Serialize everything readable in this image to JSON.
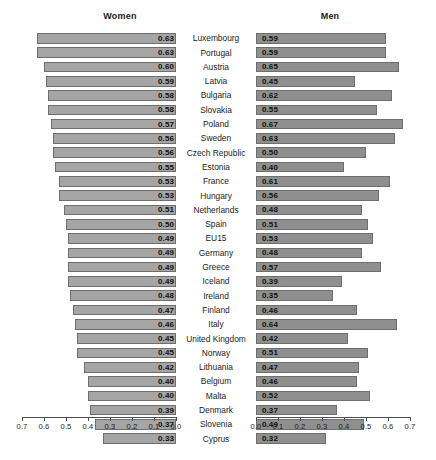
{
  "figure": {
    "left_panel_title": "Women",
    "right_panel_title": "Men"
  },
  "chart_data": {
    "type": "bar",
    "title": "",
    "subtitle": "",
    "orientation": "horizontal",
    "layout": "back-to-back paired horizontal bar chart (population pyramid style)",
    "categories": [
      "Luxembourg",
      "Portugal",
      "Austria",
      "Latvia",
      "Bulgaria",
      "Slovakia",
      "Poland",
      "Sweden",
      "Czech Republic",
      "Estonia",
      "France",
      "Hungary",
      "Netherlands",
      "Spain",
      "EU15",
      "Germany",
      "Greece",
      "Iceland",
      "Ireland",
      "Finland",
      "Italy",
      "United Kingdom",
      "Norway",
      "Lithuania",
      "Belgium",
      "Malta",
      "Denmark",
      "Slovenia",
      "Cyprus"
    ],
    "series": [
      {
        "name": "Women",
        "panel": "left",
        "axis_direction": "reversed",
        "values": [
          0.63,
          0.63,
          0.6,
          0.59,
          0.58,
          0.58,
          0.57,
          0.56,
          0.56,
          0.55,
          0.53,
          0.53,
          0.51,
          0.5,
          0.49,
          0.49,
          0.49,
          0.49,
          0.48,
          0.47,
          0.46,
          0.45,
          0.45,
          0.42,
          0.4,
          0.4,
          0.39,
          0.37,
          0.33
        ]
      },
      {
        "name": "Men",
        "panel": "right",
        "axis_direction": "normal",
        "values": [
          0.59,
          0.59,
          0.65,
          0.45,
          0.62,
          0.55,
          0.67,
          0.63,
          0.5,
          0.4,
          0.61,
          0.56,
          0.48,
          0.51,
          0.53,
          0.48,
          0.57,
          0.39,
          0.35,
          0.46,
          0.64,
          0.42,
          0.51,
          0.47,
          0.46,
          0.52,
          0.37,
          0.49,
          0.32
        ]
      }
    ],
    "xlabel": "",
    "ylabel": "",
    "xlim": [
      0.0,
      0.7
    ],
    "grid": false,
    "legend_position": "none",
    "left_axis_ticks": [
      "0.7",
      "0.6",
      "0.5",
      "0.4",
      "0.3",
      "0.2",
      "0.1",
      "0.0"
    ],
    "right_axis_ticks": [
      "0.0",
      "0.1",
      "0.2",
      "0.3",
      "0.4",
      "0.5",
      "0.6",
      "0.7"
    ],
    "left_bar_color": "#a5a5a5",
    "right_bar_color": "#8f8f8f",
    "bar_border_color": "#6e6e6e",
    "background_color": "#ffffff"
  }
}
